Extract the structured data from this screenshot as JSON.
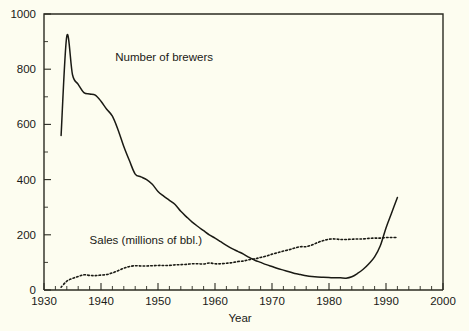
{
  "chart_data": {
    "type": "line",
    "title": "",
    "xlabel": "Year",
    "ylabel": "",
    "xlim": [
      1930,
      2000
    ],
    "ylim": [
      0,
      1000
    ],
    "grid": false,
    "legend_position": "inline-annotations",
    "x_ticks": [
      1930,
      1940,
      1950,
      1960,
      1970,
      1980,
      1990,
      2000
    ],
    "x_tick_labels": [
      "1930",
      "1940",
      "1950",
      "1960",
      "1970",
      "1980",
      "1990",
      "2000"
    ],
    "x_minor_tick_step": 2,
    "y_ticks": [
      0,
      200,
      400,
      600,
      800,
      1000
    ],
    "y_tick_labels": [
      "0",
      "200",
      "400",
      "600",
      "800",
      "1000"
    ],
    "y_minor_tick_step": 100,
    "annotations": [
      {
        "text": "Number of brewers",
        "x": 1942.5,
        "y": 830
      },
      {
        "text": "Sales (millions of bbl.)",
        "x": 1938.0,
        "y": 168
      }
    ],
    "series": [
      {
        "name": "Number of brewers",
        "style": "solid",
        "x": [
          1933,
          1934,
          1935,
          1936,
          1937,
          1938,
          1939,
          1940,
          1941,
          1942,
          1943,
          1944,
          1945,
          1946,
          1947,
          1948,
          1949,
          1950,
          1951,
          1952,
          1953,
          1954,
          1955,
          1956,
          1957,
          1958,
          1959,
          1960,
          1961,
          1962,
          1963,
          1964,
          1965,
          1966,
          1967,
          1968,
          1969,
          1970,
          1971,
          1972,
          1973,
          1974,
          1975,
          1976,
          1977,
          1978,
          1979,
          1980,
          1981,
          1982,
          1983,
          1984,
          1985,
          1986,
          1987,
          1988,
          1989,
          1990,
          1991,
          1992
        ],
        "values": [
          560,
          920,
          780,
          745,
          715,
          710,
          706,
          684,
          655,
          630,
          580,
          520,
          468,
          420,
          410,
          400,
          383,
          357,
          340,
          325,
          310,
          285,
          265,
          246,
          230,
          215,
          200,
          188,
          175,
          162,
          150,
          140,
          130,
          118,
          108,
          100,
          92,
          85,
          78,
          72,
          66,
          60,
          56,
          52,
          49,
          47,
          46,
          45,
          44,
          44,
          43,
          48,
          60,
          75,
          95,
          120,
          160,
          225,
          280,
          335
        ]
      },
      {
        "name": "Sales (millions of bbl.)",
        "style": "dotted",
        "x": [
          1933,
          1934,
          1935,
          1936,
          1937,
          1938,
          1939,
          1940,
          1941,
          1942,
          1943,
          1944,
          1945,
          1946,
          1947,
          1948,
          1949,
          1950,
          1951,
          1952,
          1953,
          1954,
          1955,
          1956,
          1957,
          1958,
          1959,
          1960,
          1961,
          1962,
          1963,
          1964,
          1965,
          1966,
          1967,
          1968,
          1969,
          1970,
          1971,
          1972,
          1973,
          1974,
          1975,
          1976,
          1977,
          1978,
          1979,
          1980,
          1981,
          1982,
          1983,
          1984,
          1985,
          1986,
          1987,
          1988,
          1989,
          1990,
          1991,
          1992
        ],
        "values": [
          10,
          32,
          42,
          49,
          55,
          53,
          52,
          54,
          56,
          62,
          70,
          79,
          85,
          88,
          87,
          87,
          88,
          89,
          89,
          89,
          91,
          92,
          93,
          95,
          95,
          94,
          98,
          95,
          95,
          97,
          99,
          103,
          105,
          110,
          113,
          118,
          123,
          130,
          135,
          141,
          146,
          152,
          157,
          157,
          163,
          172,
          179,
          184,
          185,
          183,
          183,
          184,
          185,
          185,
          187,
          188,
          188,
          190,
          190,
          190
        ]
      }
    ]
  }
}
